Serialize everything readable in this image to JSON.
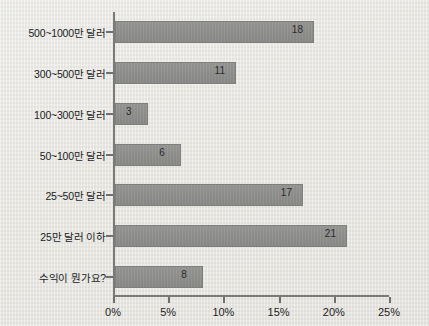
{
  "chart_data": {
    "type": "bar",
    "orientation": "horizontal",
    "title": "",
    "xlabel": "",
    "ylabel": "",
    "xlim": [
      0,
      25
    ],
    "xticks": [
      0,
      5,
      10,
      15,
      20,
      25
    ],
    "xtick_labels": [
      "0%",
      "5%",
      "10%",
      "15%",
      "20%",
      "25%"
    ],
    "grid": false,
    "legend": false,
    "categories": [
      "500~1000만 달러",
      "300~500만 달러",
      "100~300만 달러",
      "50~100만 달러",
      "25~50만 달러",
      "25만 달러 이하",
      "수익이 뭔가요?"
    ],
    "values": [
      18,
      11,
      3,
      6,
      17,
      21,
      8
    ],
    "value_labels": [
      "18",
      "11",
      "3",
      "6",
      "17",
      "21",
      "8"
    ],
    "value_unit": "%",
    "colors": {
      "bar": "#8e8e8d",
      "bar_border": "#7f7f7e",
      "axis": "#7a7a78",
      "text": "#1c1c1c",
      "background": "#e8e7e3"
    }
  }
}
